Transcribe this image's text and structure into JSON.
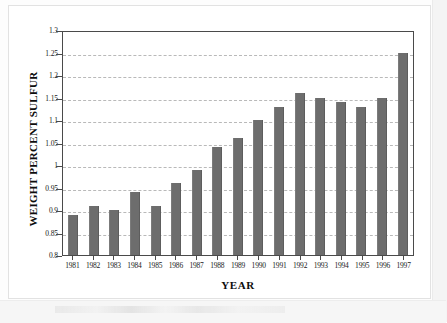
{
  "chart_data": {
    "type": "bar",
    "title": "",
    "xlabel": "YEAR",
    "ylabel": "WEIGHT PERCENT SULFUR",
    "categories": [
      "1981",
      "1982",
      "1983",
      "1984",
      "1985",
      "1986",
      "1987",
      "1988",
      "1989",
      "1990",
      "1991",
      "1992",
      "1993",
      "1994",
      "1995",
      "1996",
      "1997"
    ],
    "values": [
      0.89,
      0.91,
      0.9,
      0.94,
      0.91,
      0.96,
      0.99,
      1.04,
      1.06,
      1.1,
      1.13,
      1.16,
      1.15,
      1.14,
      1.13,
      1.15,
      1.25
    ],
    "ylim": [
      0.8,
      1.3
    ],
    "yticks": [
      0.8,
      0.85,
      0.9,
      0.95,
      1,
      1.05,
      1.1,
      1.15,
      1.2,
      1.25,
      1.3
    ],
    "ytick_labels": [
      "0.8",
      "0.85",
      "0.9",
      "0.95",
      "1",
      "1.05",
      "1.1",
      "1.15",
      "1.2",
      "1.25",
      "1.3"
    ],
    "grid": true,
    "grid_axis": "y",
    "legend": null,
    "series": [
      {
        "name": "Weight Percent Sulfur",
        "color": "#6d6d6d",
        "values": [
          0.89,
          0.91,
          0.9,
          0.94,
          0.91,
          0.96,
          0.99,
          1.04,
          1.06,
          1.1,
          1.13,
          1.16,
          1.15,
          1.14,
          1.13,
          1.15,
          1.25
        ]
      }
    ]
  },
  "style": {
    "bar_color": "#6d6d6d",
    "axis_color": "#4a4a4a",
    "grid_color": "#b9b9b9",
    "text_color": "#1a1a1a",
    "background": "#ffffff"
  }
}
